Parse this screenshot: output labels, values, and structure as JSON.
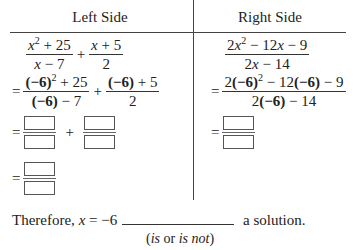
{
  "table": {
    "left_header": "Left Side",
    "right_header": "Right Side",
    "left": {
      "row1": {
        "term1": {
          "num_base": "x",
          "num_exp": "2",
          "num_rest": " + 25",
          "den": "x − 7"
        },
        "op": "+",
        "term2": {
          "num": "x + 5",
          "den": "2"
        }
      },
      "row2": {
        "eq": "=",
        "term1": {
          "num_neg": "(−6)",
          "num_exp": "2",
          "num_rest": " + 25",
          "den_neg": "(−6)",
          "den_rest": " − 7"
        },
        "op": "+",
        "term2": {
          "num_neg": "(−6)",
          "num_rest": " + 5",
          "den": "2"
        }
      },
      "row3": {
        "eq": "=",
        "op": "+",
        "boxes": 2
      },
      "row4": {
        "eq": "=",
        "boxes": 1
      }
    },
    "right": {
      "row1": {
        "num_pre": "2",
        "num_base": "x",
        "num_exp": "2",
        "num_mid": " − 12",
        "num_base2": "x",
        "num_rest": " − 9",
        "den_pre": "2",
        "den_base": "x",
        "den_rest": " − 14"
      },
      "row2": {
        "eq": "=",
        "num_pre": "2",
        "num_neg": "(−6)",
        "num_exp": "2",
        "num_mid": " − 12",
        "num_neg2": "(−6)",
        "num_rest": " − 9",
        "den_pre": "2",
        "den_neg": "(−6)",
        "den_rest": " − 14"
      },
      "row3": {
        "eq": "=",
        "boxes": 1
      }
    }
  },
  "conclusion": {
    "prefix": "Therefore, ",
    "var": "x",
    "value": " = −6",
    "suffix": " a solution.",
    "hint_open": "(",
    "hint_is": "is",
    "hint_or": " or ",
    "hint_isnot": "is not",
    "hint_close": ")"
  }
}
